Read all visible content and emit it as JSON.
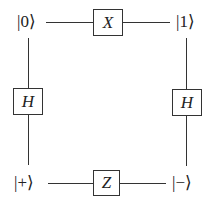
{
  "diagram": {
    "states": {
      "top_left": "|0⟩",
      "top_right": "|1⟩",
      "bottom_left": "|+⟩",
      "bottom_right": "|−⟩"
    },
    "gates": {
      "top": "X",
      "left": "H",
      "right": "H",
      "bottom": "Z"
    }
  }
}
